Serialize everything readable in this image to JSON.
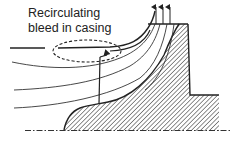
{
  "diagram": {
    "annotation": {
      "line1": "Recirculating",
      "line2": "bleed in casing"
    },
    "elements": {
      "casing": "shroud / casing wall (top curve)",
      "hub": "impeller hub (hatched)",
      "axis": "centerline (dash-dot)",
      "streamlines": 4,
      "outlet_arrows": 3,
      "bleed_region": "dashed ellipse",
      "recirculation_path": "arrowed line from hub region up to casing bleed"
    },
    "colors": {
      "stroke": "#222222",
      "background": "#ffffff"
    }
  }
}
